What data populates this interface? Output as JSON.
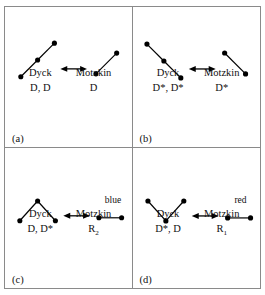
{
  "figure": {
    "colors": {
      "stroke": "#000000",
      "dot": "#000000",
      "border": "#8a8a8a",
      "background": "#ffffff"
    },
    "panels": [
      {
        "tag": "(a)",
        "left_name": "Dyck",
        "left_code": "D, D",
        "right_name": "Motzkin",
        "right_code": "D",
        "arrow": "double-headed-arrow",
        "left_shape": "two-up-steps",
        "right_shape": "one-up-step",
        "annotation": ""
      },
      {
        "tag": "(b)",
        "left_name": "Dyck",
        "left_code": "D*, D*",
        "right_name": "Motzkin",
        "right_code": "D*",
        "arrow": "double-headed-arrow",
        "left_shape": "two-down-steps",
        "right_shape": "one-down-step",
        "annotation": ""
      },
      {
        "tag": "(c)",
        "left_name": "Dyck",
        "left_code": "D, D*",
        "right_name": "Motzkin",
        "right_code": "R2",
        "arrow": "double-headed-arrow",
        "left_shape": "peak",
        "right_shape": "flat-step",
        "annotation": "blue"
      },
      {
        "tag": "(d)",
        "left_name": "Dyck",
        "left_code": "D*, D",
        "right_name": "Motzkin",
        "right_code": "R1",
        "arrow": "double-headed-arrow",
        "left_shape": "valley",
        "right_shape": "flat-step",
        "annotation": "red"
      }
    ]
  }
}
